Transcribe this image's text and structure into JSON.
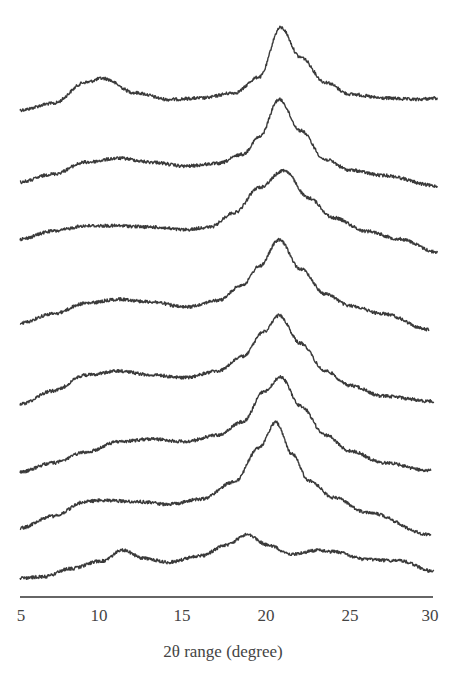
{
  "chart_data": {
    "type": "line",
    "title": "",
    "subtitle": "",
    "xlabel": "2θ range (degree)",
    "ylabel": "",
    "xlim": [
      5,
      30
    ],
    "x_ticks": [
      5,
      10,
      15,
      20,
      25,
      30
    ],
    "grid": false,
    "legend": null,
    "layout": "stacked (offset) XRD patterns, no y-axis",
    "series": [
      {
        "name": "pattern-1 (top)",
        "baseline_offset": 1,
        "points": [
          [
            5,
            0.0
          ],
          [
            7,
            0.1
          ],
          [
            9,
            0.42
          ],
          [
            10,
            0.48
          ],
          [
            12,
            0.26
          ],
          [
            14,
            0.16
          ],
          [
            16,
            0.18
          ],
          [
            18,
            0.26
          ],
          [
            19.5,
            0.5
          ],
          [
            20.8,
            1.25
          ],
          [
            22,
            0.8
          ],
          [
            23.5,
            0.42
          ],
          [
            25,
            0.24
          ],
          [
            27,
            0.18
          ],
          [
            29,
            0.16
          ],
          [
            30.3,
            0.18
          ]
        ]
      },
      {
        "name": "pattern-2",
        "baseline_offset": 2,
        "points": [
          [
            5,
            0.0
          ],
          [
            7,
            0.12
          ],
          [
            9,
            0.3
          ],
          [
            11,
            0.36
          ],
          [
            13,
            0.3
          ],
          [
            15,
            0.24
          ],
          [
            17,
            0.28
          ],
          [
            18.5,
            0.42
          ],
          [
            19.5,
            0.68
          ],
          [
            20.7,
            1.25
          ],
          [
            22,
            0.78
          ],
          [
            23.5,
            0.34
          ],
          [
            25,
            0.18
          ],
          [
            27,
            0.1
          ],
          [
            30.3,
            -0.06
          ]
        ]
      },
      {
        "name": "pattern-3",
        "baseline_offset": 3,
        "points": [
          [
            5,
            0.0
          ],
          [
            7,
            0.12
          ],
          [
            9,
            0.2
          ],
          [
            11,
            0.2
          ],
          [
            13,
            0.18
          ],
          [
            15,
            0.14
          ],
          [
            16.5,
            0.18
          ],
          [
            18,
            0.4
          ],
          [
            19.5,
            0.78
          ],
          [
            21,
            1.04
          ],
          [
            22.5,
            0.62
          ],
          [
            24,
            0.32
          ],
          [
            26,
            0.12
          ],
          [
            28,
            0.0
          ],
          [
            30.3,
            -0.2
          ]
        ]
      },
      {
        "name": "pattern-4",
        "baseline_offset": 4,
        "points": [
          [
            5,
            0.0
          ],
          [
            7,
            0.14
          ],
          [
            9,
            0.3
          ],
          [
            11,
            0.36
          ],
          [
            13,
            0.32
          ],
          [
            15,
            0.24
          ],
          [
            17,
            0.34
          ],
          [
            18.5,
            0.58
          ],
          [
            19.5,
            0.86
          ],
          [
            20.7,
            1.26
          ],
          [
            22,
            0.82
          ],
          [
            23.5,
            0.44
          ],
          [
            25,
            0.26
          ],
          [
            27,
            0.14
          ],
          [
            29.8,
            -0.1
          ]
        ]
      },
      {
        "name": "pattern-5",
        "baseline_offset": 5,
        "points": [
          [
            5,
            0.0
          ],
          [
            7,
            0.2
          ],
          [
            9,
            0.44
          ],
          [
            11,
            0.5
          ],
          [
            13,
            0.44
          ],
          [
            15,
            0.4
          ],
          [
            17,
            0.5
          ],
          [
            18.5,
            0.72
          ],
          [
            19.8,
            1.1
          ],
          [
            20.7,
            1.34
          ],
          [
            22,
            0.92
          ],
          [
            23.5,
            0.5
          ],
          [
            25,
            0.28
          ],
          [
            27,
            0.12
          ],
          [
            30.1,
            0.04
          ]
        ]
      },
      {
        "name": "pattern-6",
        "baseline_offset": 6,
        "points": [
          [
            5,
            0.0
          ],
          [
            7,
            0.14
          ],
          [
            9,
            0.3
          ],
          [
            11,
            0.46
          ],
          [
            13,
            0.5
          ],
          [
            15,
            0.46
          ],
          [
            17,
            0.56
          ],
          [
            18.5,
            0.76
          ],
          [
            19.8,
            1.22
          ],
          [
            20.8,
            1.44
          ],
          [
            22,
            1.0
          ],
          [
            23.5,
            0.56
          ],
          [
            25,
            0.32
          ],
          [
            27,
            0.14
          ],
          [
            29.9,
            0.02
          ]
        ]
      },
      {
        "name": "pattern-7",
        "baseline_offset": 7,
        "points": [
          [
            5,
            0.0
          ],
          [
            7,
            0.18
          ],
          [
            9,
            0.4
          ],
          [
            10,
            0.42
          ],
          [
            12,
            0.4
          ],
          [
            14,
            0.36
          ],
          [
            16,
            0.44
          ],
          [
            18,
            0.7
          ],
          [
            19.5,
            1.22
          ],
          [
            20.5,
            1.6
          ],
          [
            21.5,
            1.12
          ],
          [
            22.5,
            0.72
          ],
          [
            24,
            0.46
          ],
          [
            26,
            0.24
          ],
          [
            29.9,
            -0.1
          ]
        ]
      },
      {
        "name": "pattern-8 (bottom)",
        "baseline_offset": 8,
        "points": [
          [
            5,
            0.0
          ],
          [
            6.5,
            0.02
          ],
          [
            8,
            0.14
          ],
          [
            10,
            0.26
          ],
          [
            11.2,
            0.42
          ],
          [
            12.5,
            0.3
          ],
          [
            14,
            0.24
          ],
          [
            16,
            0.34
          ],
          [
            17.5,
            0.5
          ],
          [
            18.8,
            0.66
          ],
          [
            20,
            0.5
          ],
          [
            21.5,
            0.36
          ],
          [
            23,
            0.42
          ],
          [
            24,
            0.4
          ],
          [
            26,
            0.28
          ],
          [
            28,
            0.26
          ],
          [
            30.1,
            0.1
          ]
        ]
      }
    ],
    "pixel_mapping": {
      "x0_px": 20,
      "px_per_degree": 16.5,
      "baselines_px": [
        110,
        182,
        239,
        323,
        404,
        472,
        528,
        578
      ],
      "px_per_unit": 66
    }
  },
  "axis": {
    "title": "2θ range (degree)",
    "tick_labels": [
      "5",
      "10",
      "15",
      "20",
      "25",
      "30"
    ]
  },
  "colors": {
    "trace": "#3a3a3a",
    "axis": "#333333",
    "text": "#444444",
    "background": "#ffffff"
  }
}
